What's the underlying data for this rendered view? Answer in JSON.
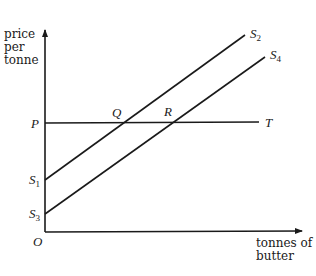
{
  "diagram": {
    "type": "supply-price diagram",
    "y_axis_label": [
      "price",
      "per",
      "tonne"
    ],
    "x_axis_label": [
      "tonnes of",
      "butter"
    ],
    "origin_label": "O",
    "price_line": {
      "start_label": "P",
      "end_label": "T"
    },
    "supply_curves": [
      {
        "start_label": "S",
        "start_sub": "1",
        "end_label": "S",
        "end_sub": "2"
      },
      {
        "start_label": "S",
        "start_sub": "3",
        "end_label": "S",
        "end_sub": "4"
      }
    ],
    "intersections": [
      {
        "label": "Q",
        "between": [
          "S1S2",
          "PT"
        ]
      },
      {
        "label": "R",
        "between": [
          "S3S4",
          "PT"
        ]
      }
    ]
  }
}
